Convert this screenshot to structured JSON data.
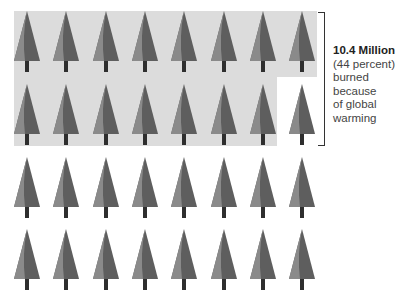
{
  "figure": {
    "rows": 4,
    "trees_per_row": 8,
    "total_trees": 32,
    "highlighted_trees": 15,
    "colors": {
      "shade": "#dcdcdc",
      "tree_light": "#8a8a8a",
      "tree_dark": "#5e5e5e",
      "trunk": "#2e2e2e",
      "bracket": "#333333"
    }
  },
  "annotation": {
    "headline": "10.4 Million",
    "line1": "(44 percent)",
    "line2": "burned",
    "line3": "because",
    "line4": "of global",
    "line5": "warming"
  }
}
